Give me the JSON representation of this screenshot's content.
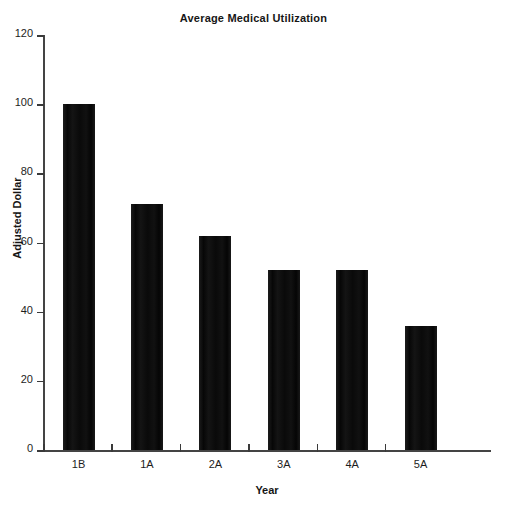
{
  "chart_data": {
    "type": "bar",
    "title": "Average Medical Utilization",
    "xlabel": "Year",
    "ylabel": "Adjusted Dollar",
    "categories": [
      "1B",
      "1A",
      "2A",
      "3A",
      "4A",
      "5A"
    ],
    "values": [
      100,
      71,
      62,
      52,
      52,
      36
    ],
    "ylim": [
      0,
      120
    ],
    "yticks": [
      0,
      20,
      40,
      60,
      80,
      100,
      120
    ],
    "ytick_labels": [
      "0",
      "20",
      "40",
      "60",
      "80",
      "100",
      "120"
    ],
    "grid": false,
    "legend": null,
    "bar_color": "#0d0d0d",
    "axis_color": "#3a3a3a",
    "background_color": "#ffffff"
  }
}
